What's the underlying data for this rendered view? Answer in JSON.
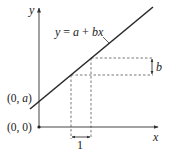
{
  "diagram": {
    "type": "linear-function-graph",
    "equation": {
      "label": "y = a + bx",
      "parts": [
        "y",
        " = ",
        "a",
        " + ",
        "b",
        "x"
      ]
    },
    "axes": {
      "x_label": "x",
      "y_label": "y"
    },
    "points": {
      "intercept_label": "(0, a)",
      "intercept_parts": [
        "(0, ",
        "a",
        ")"
      ],
      "origin_label": "(0, 0)"
    },
    "annotations": {
      "rise_label": "b",
      "run_label": "1"
    },
    "colors": {
      "line": "#2a2a2a",
      "axis": "#444444",
      "dashed": "#555555",
      "text": "#222222",
      "background": "#ffffff"
    }
  }
}
